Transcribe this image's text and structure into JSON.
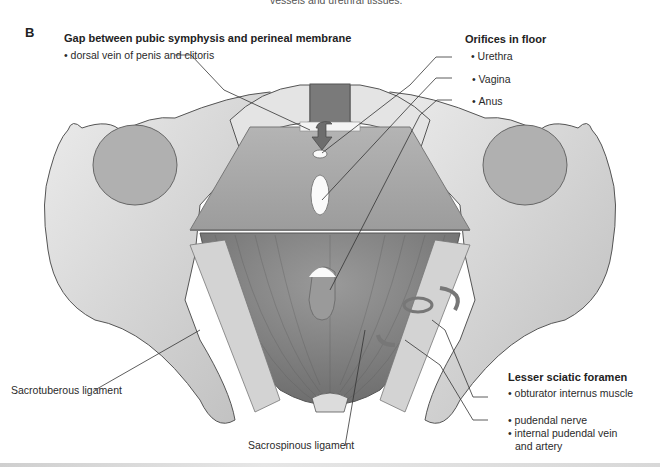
{
  "figure": {
    "panel_label": "B",
    "top_cutoff_text": "vessels and urethral tissues.",
    "groups": {
      "gap": {
        "title": "Gap between pubic symphysis and perineal membrane",
        "items": [
          "dorsal vein of penis and clitoris"
        ]
      },
      "orifices": {
        "title": "Orifices in floor",
        "items": [
          "Urethra",
          "Vagina",
          "Anus"
        ]
      },
      "lesser_sciatic": {
        "title": "Lesser sciatic foramen",
        "items": [
          "obturator internus muscle",
          "pudendal nerve",
          "internal pudendal vein",
          "and artery"
        ]
      }
    },
    "standalone_labels": {
      "sacrotuberous": "Sacrotuberous ligament",
      "sacrospinous": "Sacrospinous ligament"
    },
    "colors": {
      "bone": "#d9d9d9",
      "bone_shadow": "#9e9e9e",
      "membrane": "#a8a8a8",
      "muscle": "#858585",
      "ligament": "#cdcdcd",
      "outline": "#555555",
      "leader": "#333333"
    }
  }
}
